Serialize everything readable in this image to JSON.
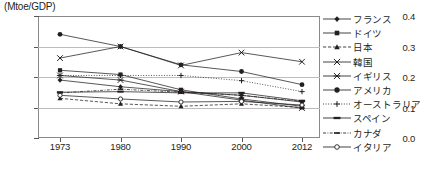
{
  "chart": {
    "type": "line",
    "axis_title": "(Mtoe/GDP)",
    "ylabel": "(Mtoe/GDP)",
    "xlabel": "",
    "grid": true,
    "legend_position": "right",
    "ylim": [
      0.0,
      0.4
    ],
    "yticks": [
      "0.0",
      "0.1",
      "0.2",
      "0.3",
      "0.4"
    ],
    "ytick_values": [
      0.0,
      0.1,
      0.2,
      0.3,
      0.4
    ],
    "categories": [
      "1973",
      "1980",
      "1990",
      "2000",
      "2012"
    ],
    "x": [
      1973,
      1980,
      1990,
      2000,
      2012
    ]
  },
  "chart_data": {
    "type": "line",
    "title": "",
    "xlabel": "",
    "ylabel": "(Mtoe/GDP)",
    "ylim": [
      0.0,
      0.4
    ],
    "grid": true,
    "legend_position": "right",
    "categories": [
      "1973",
      "1980",
      "1990",
      "2000",
      "2012"
    ],
    "x": [
      1973,
      1980,
      1990,
      2000,
      2012
    ],
    "series": [
      {
        "name": "フランス",
        "marker": "diamond",
        "line": "solid",
        "values": [
          0.19,
          0.168,
          0.152,
          0.14,
          0.118
        ]
      },
      {
        "name": "ドイツ",
        "marker": "square",
        "line": "solid",
        "values": [
          0.222,
          0.208,
          0.158,
          0.128,
          0.104
        ]
      },
      {
        "name": "日本",
        "marker": "triangle",
        "line": "dashed",
        "values": [
          0.13,
          0.112,
          0.104,
          0.112,
          0.1
        ]
      },
      {
        "name": "韓国",
        "marker": "cross",
        "line": "solid",
        "values": [
          0.262,
          0.3,
          0.238,
          0.28,
          0.25
        ]
      },
      {
        "name": "イギリス",
        "marker": "asterisk",
        "line": "solid",
        "values": [
          0.205,
          0.19,
          0.152,
          0.124,
          0.098
        ]
      },
      {
        "name": "アメリカ",
        "marker": "circle",
        "line": "solid",
        "values": [
          0.34,
          0.3,
          0.24,
          0.218,
          0.175
        ]
      },
      {
        "name": "オーストラリア",
        "marker": "plus",
        "line": "dotted",
        "values": [
          0.205,
          0.205,
          0.205,
          0.188,
          0.152
        ]
      },
      {
        "name": "スペイン",
        "marker": "bar",
        "line": "solid",
        "values": [
          0.15,
          0.152,
          0.148,
          0.148,
          0.122
        ]
      },
      {
        "name": "カナダ",
        "marker": "smalldash",
        "line": "dashdot",
        "values": [
          0.148,
          0.16,
          0.15,
          0.14,
          0.12
        ]
      },
      {
        "name": "イタリア",
        "marker": "opencircle",
        "line": "solid",
        "values": [
          0.14,
          0.128,
          0.118,
          0.12,
          0.108
        ]
      }
    ]
  },
  "legend": {
    "items": [
      {
        "label": "フランス"
      },
      {
        "label": "ドイツ"
      },
      {
        "label": "日本"
      },
      {
        "label": "韓国"
      },
      {
        "label": "イギリス"
      },
      {
        "label": "アメリカ"
      },
      {
        "label": "オーストラリア"
      },
      {
        "label": "スペイン"
      },
      {
        "label": "カナダ"
      },
      {
        "label": "イタリア"
      }
    ]
  },
  "colors": {
    "ink": "#231f20",
    "grid": "#bdbdbd",
    "frame": "#8a8a8a",
    "background": "#ffffff"
  }
}
